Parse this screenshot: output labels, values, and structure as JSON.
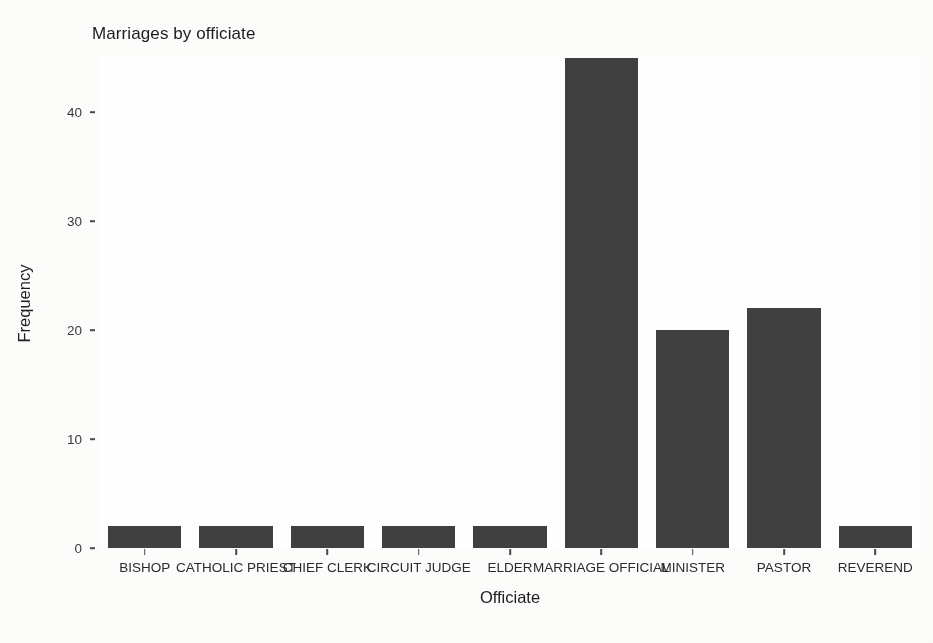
{
  "figure": {
    "title": "Marriages by officiate",
    "xlabel": "Officiate",
    "ylabel": "Frequency"
  },
  "chart_data": {
    "type": "bar",
    "title": "Marriages by officiate",
    "xlabel": "Officiate",
    "ylabel": "Frequency",
    "categories": [
      "BISHOP",
      "CATHOLIC PRIEST",
      "CHIEF CLERK",
      "CIRCUIT JUDGE",
      "ELDER",
      "MARRIAGE OFFICIAL",
      "MINISTER",
      "PASTOR",
      "REVEREND"
    ],
    "values": [
      2,
      2,
      2,
      2,
      2,
      45,
      20,
      22,
      2
    ],
    "ylim": [
      0,
      45
    ],
    "yticks": [
      0,
      10,
      20,
      30,
      40
    ],
    "ytick_labels": [
      "0",
      "10",
      "20",
      "30",
      "40"
    ],
    "grid": false,
    "legend": "none",
    "bar_color": "#404040",
    "panel_background": "#ffffff"
  }
}
